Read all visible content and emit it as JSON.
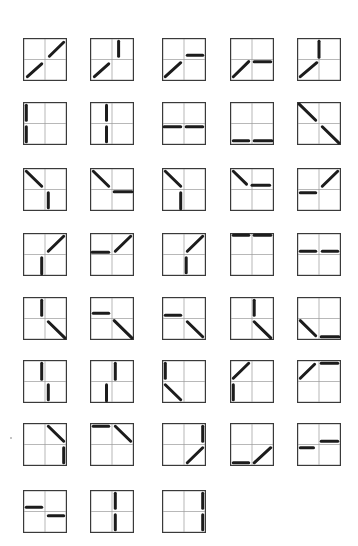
{
  "figure": {
    "panel_size_units": 2,
    "colors": {
      "frame": "#3a3a3a",
      "grid": "#9a9a9a",
      "segment": "#1c1c1c",
      "background": "#ffffff"
    },
    "columns_x": [
      23,
      90,
      162,
      230,
      297
    ],
    "rows_y": [
      38,
      102,
      168,
      233,
      297,
      360,
      423,
      490
    ],
    "panels": [
      {
        "row": 0,
        "col": 0,
        "segments": [
          [
            0.2,
            1.8,
            0.85,
            1.2
          ],
          [
            1.2,
            0.85,
            1.85,
            0.2
          ]
        ]
      },
      {
        "row": 0,
        "col": 1,
        "segments": [
          [
            0.2,
            1.8,
            0.85,
            1.2
          ],
          [
            1.3,
            0.15,
            1.3,
            0.85
          ]
        ]
      },
      {
        "row": 0,
        "col": 2,
        "segments": [
          [
            0.15,
            1.8,
            0.85,
            1.15
          ],
          [
            1.15,
            0.8,
            1.85,
            0.8
          ]
        ]
      },
      {
        "row": 0,
        "col": 3,
        "segments": [
          [
            0.15,
            1.8,
            0.85,
            1.1
          ],
          [
            1.1,
            1.1,
            1.85,
            1.1
          ]
        ]
      },
      {
        "row": 0,
        "col": 4,
        "segments": [
          [
            0.15,
            1.8,
            0.9,
            1.15
          ],
          [
            1.0,
            0.15,
            1.0,
            0.9
          ]
        ]
      },
      {
        "row": 1,
        "col": 0,
        "segments": [
          [
            0.15,
            0.15,
            0.15,
            0.85
          ],
          [
            0.15,
            1.15,
            0.15,
            1.85
          ]
        ]
      },
      {
        "row": 1,
        "col": 1,
        "segments": [
          [
            0.75,
            0.15,
            0.75,
            0.85
          ],
          [
            0.75,
            1.15,
            0.75,
            1.85
          ]
        ]
      },
      {
        "row": 1,
        "col": 2,
        "segments": [
          [
            0.1,
            1.15,
            0.85,
            1.15
          ],
          [
            1.1,
            1.15,
            1.85,
            1.15
          ]
        ]
      },
      {
        "row": 1,
        "col": 3,
        "segments": [
          [
            0.15,
            1.8,
            0.85,
            1.8
          ],
          [
            1.1,
            1.8,
            1.9,
            1.8
          ]
        ]
      },
      {
        "row": 1,
        "col": 4,
        "segments": [
          [
            0.1,
            0.1,
            0.85,
            0.85
          ],
          [
            1.15,
            1.15,
            1.9,
            1.9
          ]
        ]
      },
      {
        "row": 2,
        "col": 0,
        "segments": [
          [
            0.15,
            0.15,
            0.85,
            0.85
          ],
          [
            1.15,
            1.15,
            1.15,
            1.85
          ]
        ]
      },
      {
        "row": 2,
        "col": 1,
        "segments": [
          [
            0.15,
            0.15,
            0.85,
            0.85
          ],
          [
            1.1,
            1.1,
            1.9,
            1.1
          ]
        ]
      },
      {
        "row": 2,
        "col": 2,
        "segments": [
          [
            0.15,
            0.15,
            0.85,
            0.85
          ],
          [
            0.85,
            1.15,
            0.85,
            1.9
          ]
        ]
      },
      {
        "row": 2,
        "col": 3,
        "segments": [
          [
            0.15,
            0.15,
            0.75,
            0.75
          ],
          [
            1.0,
            0.8,
            1.8,
            0.8
          ]
        ]
      },
      {
        "row": 2,
        "col": 4,
        "segments": [
          [
            0.15,
            1.15,
            0.85,
            1.15
          ],
          [
            1.15,
            0.85,
            1.85,
            0.15
          ]
        ]
      },
      {
        "row": 3,
        "col": 0,
        "segments": [
          [
            0.85,
            1.15,
            0.85,
            1.9
          ],
          [
            1.15,
            0.85,
            1.85,
            0.15
          ]
        ]
      },
      {
        "row": 3,
        "col": 1,
        "segments": [
          [
            0.1,
            0.9,
            0.85,
            0.9
          ],
          [
            1.15,
            0.85,
            1.85,
            0.15
          ]
        ]
      },
      {
        "row": 3,
        "col": 2,
        "segments": [
          [
            1.1,
            1.15,
            1.1,
            1.85
          ],
          [
            1.15,
            0.85,
            1.85,
            0.15
          ]
        ]
      },
      {
        "row": 3,
        "col": 3,
        "segments": [
          [
            0.15,
            0.1,
            0.85,
            0.1
          ],
          [
            1.1,
            0.1,
            1.85,
            0.1
          ]
        ]
      },
      {
        "row": 3,
        "col": 4,
        "segments": [
          [
            0.15,
            0.85,
            0.85,
            0.85
          ],
          [
            1.15,
            0.85,
            1.85,
            0.85
          ]
        ]
      },
      {
        "row": 4,
        "col": 0,
        "segments": [
          [
            0.85,
            0.15,
            0.85,
            0.85
          ],
          [
            1.15,
            1.15,
            1.9,
            1.9
          ]
        ]
      },
      {
        "row": 4,
        "col": 1,
        "segments": [
          [
            0.15,
            0.75,
            0.85,
            0.75
          ],
          [
            1.1,
            1.1,
            1.9,
            1.9
          ]
        ]
      },
      {
        "row": 4,
        "col": 2,
        "segments": [
          [
            0.15,
            0.85,
            0.85,
            0.85
          ],
          [
            1.15,
            1.15,
            1.85,
            1.85
          ]
        ]
      },
      {
        "row": 4,
        "col": 3,
        "segments": [
          [
            1.1,
            0.15,
            1.1,
            0.85
          ],
          [
            1.1,
            1.15,
            1.85,
            1.9
          ]
        ]
      },
      {
        "row": 4,
        "col": 4,
        "segments": [
          [
            0.15,
            1.1,
            0.85,
            1.8
          ],
          [
            1.1,
            1.85,
            1.9,
            1.85
          ]
        ]
      },
      {
        "row": 5,
        "col": 0,
        "segments": [
          [
            0.85,
            0.15,
            0.85,
            0.9
          ],
          [
            1.15,
            1.15,
            1.15,
            1.85
          ]
        ]
      },
      {
        "row": 5,
        "col": 1,
        "segments": [
          [
            1.15,
            0.15,
            1.15,
            0.9
          ],
          [
            0.75,
            1.15,
            0.75,
            1.9
          ]
        ]
      },
      {
        "row": 5,
        "col": 2,
        "segments": [
          [
            0.15,
            0.15,
            0.15,
            0.85
          ],
          [
            0.15,
            1.15,
            0.85,
            1.85
          ]
        ]
      },
      {
        "row": 5,
        "col": 3,
        "segments": [
          [
            0.15,
            0.85,
            0.85,
            0.15
          ],
          [
            0.15,
            1.15,
            0.15,
            1.85
          ]
        ]
      },
      {
        "row": 5,
        "col": 4,
        "segments": [
          [
            0.15,
            0.85,
            0.8,
            0.2
          ],
          [
            1.1,
            0.15,
            1.85,
            0.15
          ]
        ]
      },
      {
        "row": 6,
        "col": 0,
        "segments": [
          [
            1.15,
            0.15,
            1.85,
            0.85
          ],
          [
            1.85,
            1.15,
            1.85,
            1.85
          ]
        ]
      },
      {
        "row": 6,
        "col": 1,
        "segments": [
          [
            0.15,
            0.15,
            0.85,
            0.15
          ],
          [
            1.15,
            0.15,
            1.85,
            0.85
          ]
        ]
      },
      {
        "row": 6,
        "col": 2,
        "segments": [
          [
            1.85,
            0.15,
            1.85,
            0.85
          ],
          [
            1.15,
            1.85,
            1.85,
            1.15
          ]
        ]
      },
      {
        "row": 6,
        "col": 3,
        "segments": [
          [
            0.15,
            1.85,
            0.85,
            1.85
          ],
          [
            1.1,
            1.85,
            1.85,
            1.15
          ]
        ]
      },
      {
        "row": 6,
        "col": 4,
        "segments": [
          [
            0.15,
            1.15,
            0.75,
            1.15
          ],
          [
            1.1,
            0.85,
            1.85,
            0.85
          ]
        ]
      },
      {
        "row": 7,
        "col": 0,
        "segments": [
          [
            0.15,
            0.8,
            0.85,
            0.8
          ],
          [
            1.15,
            1.2,
            1.85,
            1.2
          ]
        ]
      },
      {
        "row": 7,
        "col": 1,
        "segments": [
          [
            1.15,
            0.15,
            1.15,
            0.85
          ],
          [
            1.15,
            1.15,
            1.15,
            1.85
          ]
        ]
      },
      {
        "row": 7,
        "col": 2,
        "segments": [
          [
            1.85,
            0.15,
            1.85,
            0.85
          ],
          [
            1.85,
            1.15,
            1.85,
            1.85
          ]
        ]
      }
    ]
  }
}
